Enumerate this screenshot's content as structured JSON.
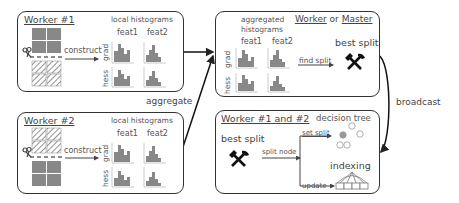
{
  "worker1": {
    "title": "Worker #1",
    "local_label": "local histograms",
    "construct_label": "construct",
    "feat1": "feat1",
    "feat2": "feat2",
    "grad": "grad",
    "hess": "hess"
  },
  "worker2": {
    "title": "Worker #2",
    "local_label": "local histograms",
    "construct_label": "construct",
    "feat1": "feat1",
    "feat2": "feat2",
    "grad": "grad",
    "hess": "hess"
  },
  "master": {
    "title_a": "Worker",
    "title_or": "or",
    "title_b": "Master",
    "agg_label_1": "aggregated",
    "agg_label_2": "histograms",
    "feat1": "feat1",
    "feat2": "feat2",
    "grad": "grad",
    "hess": "hess",
    "find_split": "find split",
    "best_split": "best split",
    "icon": "hammer-pick-icon"
  },
  "update_box": {
    "title": "Worker #1 and #2",
    "best_split": "best split",
    "split_node": "split node",
    "set_split": "set split",
    "decision_tree": "decision tree",
    "indexing": "indexing",
    "update": "update",
    "icon": "hammer-pick-icon"
  },
  "flows": {
    "aggregate": "aggregate",
    "broadcast": "broadcast"
  },
  "colors": {
    "histogram": "#888888",
    "border": "#333333",
    "text": "#555555",
    "hatch": "#777777"
  }
}
